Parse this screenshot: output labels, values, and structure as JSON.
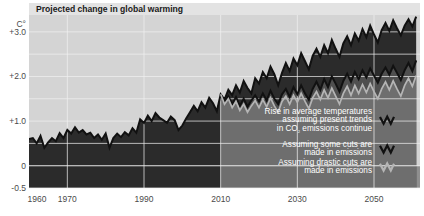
{
  "title": "Projected change in global warming",
  "unit": "C°",
  "colors": {
    "plot_upper_background": "#d4d4d4",
    "plot_lower_background": "#8f8f8f",
    "band_present_trends": "#2b2b2b",
    "band_some_cuts": "#4f4f4f",
    "band_drastic_cuts": "#6e6e6e",
    "line_present_trends": "#111111",
    "line_some_cuts": "#111111",
    "line_drastic_cuts": "#b5b5b5",
    "gridline": "#f2f2f2",
    "axis_text": "#4a4a4a",
    "legend_text": "#ffffff",
    "title_text": "#1a1a1a",
    "page_background": "#ffffff"
  },
  "legend": {
    "items": [
      {
        "name": "present-trends",
        "lines": [
          "Rise in average temperatures",
          "assuming present trends",
          "in CO₂ emissions continue"
        ],
        "icon": "zigzag-line-icon",
        "icon_color": "#111111"
      },
      {
        "name": "some-cuts",
        "lines": [
          "Assuming some cuts are",
          "made in emissions"
        ],
        "icon": "zigzag-line-icon",
        "icon_color": "#111111"
      },
      {
        "name": "drastic-cuts",
        "lines": [
          "Assuming drastic cuts are",
          "made in emissions"
        ],
        "icon": "zigzag-line-icon",
        "icon_color": "#b5b5b5"
      }
    ]
  },
  "chart_data": {
    "type": "line",
    "title": "Projected change in global warming",
    "xlabel": "",
    "ylabel": "C°",
    "xlim": [
      1960,
      2062
    ],
    "ylim": [
      -0.5,
      3.4
    ],
    "grid": true,
    "legend_position": "bottom-right",
    "y_ticks": [
      -0.5,
      0,
      1.0,
      2.0,
      3.0
    ],
    "y_tick_labels": [
      "-0.5",
      "0",
      "+1.0",
      "+2.0",
      "+3.0"
    ],
    "y_minor_gridlines": [
      0.5,
      1.5,
      2.5
    ],
    "x_ticks": [
      1960,
      1970,
      1990,
      2010,
      2030,
      2050
    ],
    "x_tick_labels": [
      "1960",
      "1970",
      "1990",
      "2010",
      "2030",
      "2050"
    ],
    "historical_end_year": 2010,
    "series": [
      {
        "name": "Rise in average temperatures assuming present trends in CO2 emissions continue",
        "color": "#111111",
        "fill": "#2b2b2b",
        "x": [
          1960,
          1961,
          1962,
          1963,
          1964,
          1965,
          1966,
          1967,
          1968,
          1969,
          1970,
          1971,
          1972,
          1973,
          1974,
          1975,
          1976,
          1977,
          1978,
          1979,
          1980,
          1981,
          1982,
          1983,
          1984,
          1985,
          1986,
          1987,
          1988,
          1989,
          1990,
          1991,
          1992,
          1993,
          1994,
          1995,
          1996,
          1997,
          1998,
          1999,
          2000,
          2001,
          2002,
          2003,
          2004,
          2005,
          2006,
          2007,
          2008,
          2009,
          2010,
          2011,
          2012,
          2013,
          2014,
          2015,
          2016,
          2017,
          2018,
          2019,
          2020,
          2021,
          2022,
          2023,
          2024,
          2025,
          2026,
          2027,
          2028,
          2029,
          2030,
          2031,
          2032,
          2033,
          2034,
          2035,
          2036,
          2037,
          2038,
          2039,
          2040,
          2041,
          2042,
          2043,
          2044,
          2045,
          2046,
          2047,
          2048,
          2049,
          2050,
          2051,
          2052,
          2053,
          2054,
          2055,
          2056,
          2057,
          2058,
          2059,
          2060,
          2061
        ],
        "y": [
          0.6,
          0.62,
          0.5,
          0.67,
          0.4,
          0.52,
          0.62,
          0.55,
          0.73,
          0.62,
          0.8,
          0.72,
          0.86,
          0.74,
          0.8,
          0.7,
          0.74,
          0.62,
          0.7,
          0.58,
          0.72,
          0.4,
          0.62,
          0.72,
          0.64,
          0.75,
          0.68,
          0.84,
          0.74,
          1.04,
          0.96,
          1.12,
          1.0,
          1.18,
          1.08,
          1.02,
          0.96,
          1.1,
          1.02,
          0.8,
          0.9,
          1.06,
          1.2,
          1.34,
          1.22,
          1.42,
          1.3,
          1.52,
          1.4,
          1.22,
          1.6,
          1.48,
          1.7,
          1.58,
          1.8,
          1.64,
          1.9,
          1.74,
          1.62,
          1.96,
          1.84,
          2.1,
          1.96,
          2.22,
          2.05,
          1.8,
          2.08,
          2.3,
          2.12,
          2.4,
          2.25,
          2.52,
          2.34,
          2.16,
          2.46,
          2.62,
          2.44,
          2.7,
          2.52,
          2.82,
          2.62,
          2.44,
          2.74,
          2.9,
          2.7,
          2.96,
          2.8,
          3.06,
          2.88,
          3.14,
          2.94,
          2.76,
          3.04,
          3.2,
          3.02,
          3.26,
          3.08,
          2.92,
          3.14,
          3.28,
          3.12,
          3.34
        ]
      },
      {
        "name": "Assuming some cuts are made in emissions",
        "color": "#111111",
        "fill": "#4f4f4f",
        "x": [
          2010,
          2011,
          2012,
          2013,
          2014,
          2015,
          2016,
          2017,
          2018,
          2019,
          2020,
          2021,
          2022,
          2023,
          2024,
          2025,
          2026,
          2027,
          2028,
          2029,
          2030,
          2031,
          2032,
          2033,
          2034,
          2035,
          2036,
          2037,
          2038,
          2039,
          2040,
          2041,
          2042,
          2043,
          2044,
          2045,
          2046,
          2047,
          2048,
          2049,
          2050,
          2051,
          2052,
          2053,
          2054,
          2055,
          2056,
          2057,
          2058,
          2059,
          2060,
          2061
        ],
        "y": [
          1.6,
          1.42,
          1.56,
          1.38,
          1.54,
          1.34,
          1.5,
          1.32,
          1.46,
          1.58,
          1.44,
          1.62,
          1.46,
          1.68,
          1.5,
          1.38,
          1.6,
          1.72,
          1.54,
          1.76,
          1.6,
          1.8,
          1.62,
          1.48,
          1.72,
          1.88,
          1.7,
          1.94,
          1.76,
          2.0,
          1.84,
          1.66,
          1.9,
          2.06,
          1.88,
          2.1,
          1.94,
          2.14,
          1.98,
          2.18,
          2.02,
          1.86,
          2.06,
          2.2,
          2.04,
          2.24,
          2.08,
          1.92,
          2.14,
          2.3,
          2.12,
          2.36
        ]
      },
      {
        "name": "Assuming drastic cuts are made in emissions",
        "color": "#b5b5b5",
        "fill": "#6e6e6e",
        "x": [
          2010,
          2011,
          2012,
          2013,
          2014,
          2015,
          2016,
          2017,
          2018,
          2019,
          2020,
          2021,
          2022,
          2023,
          2024,
          2025,
          2026,
          2027,
          2028,
          2029,
          2030,
          2031,
          2032,
          2033,
          2034,
          2035,
          2036,
          2037,
          2038,
          2039,
          2040,
          2041,
          2042,
          2043,
          2044,
          2045,
          2046,
          2047,
          2048,
          2049,
          2050,
          2051,
          2052,
          2053,
          2054,
          2055,
          2056,
          2057,
          2058,
          2059,
          2060,
          2061
        ],
        "y": [
          1.6,
          1.38,
          1.5,
          1.3,
          1.44,
          1.24,
          1.38,
          1.2,
          1.34,
          1.46,
          1.3,
          1.48,
          1.32,
          1.52,
          1.34,
          1.2,
          1.44,
          1.56,
          1.38,
          1.58,
          1.42,
          1.62,
          1.44,
          1.28,
          1.52,
          1.66,
          1.48,
          1.7,
          1.52,
          1.74,
          1.56,
          1.38,
          1.62,
          1.78,
          1.58,
          1.8,
          1.62,
          1.82,
          1.64,
          1.84,
          1.66,
          1.5,
          1.72,
          1.88,
          1.7,
          1.9,
          1.72,
          1.56,
          1.8,
          1.96,
          1.78,
          2.02
        ]
      }
    ]
  }
}
